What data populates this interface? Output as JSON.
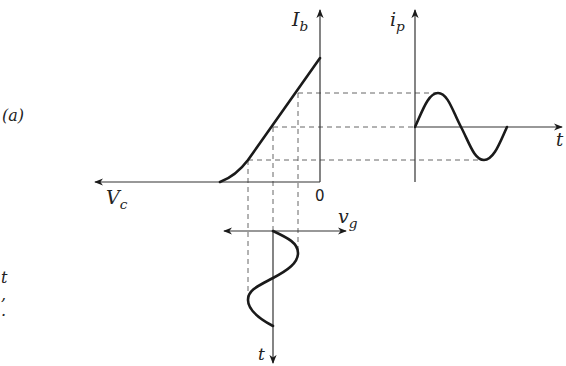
{
  "figure": {
    "panel_label": "(a)",
    "side_fragments": [
      "t",
      ",",
      "."
    ],
    "labels": {
      "ib_axis": {
        "main": "I",
        "sub": "b"
      },
      "ip_axis": {
        "main": "i",
        "sub": "p"
      },
      "vc_axis": {
        "main": "V",
        "sub": "c"
      },
      "vg_axis": {
        "main": "v",
        "sub": "g"
      },
      "t_right": "t",
      "t_bottom": "t",
      "origin": "0"
    },
    "colors": {
      "ink": "#1a1a1a",
      "axis": "#333333",
      "dash": "#555555",
      "background": "#ffffff"
    }
  },
  "geometry": {
    "transfer_axes": {
      "origin": [
        320,
        182
      ],
      "vertical_top": 10,
      "horizontal_left": 95
    },
    "transfer_curve": [
      [
        220,
        182
      ],
      [
        248,
        160
      ],
      [
        320,
        58
      ]
    ],
    "output_axes": {
      "origin": [
        415,
        127
      ],
      "vertical_top": 10,
      "vertical_bottom": 182,
      "horizontal_right": 560
    },
    "output_wave": {
      "start": [
        415,
        127
      ],
      "peak": [
        438,
        93
      ],
      "zero": [
        461,
        127
      ],
      "trough": [
        484,
        160
      ],
      "end": [
        507,
        127
      ]
    },
    "input_axes": {
      "origin": [
        273,
        231
      ],
      "left": 225,
      "right": 345,
      "bottom": 362
    },
    "input_wave": {
      "start": [
        273,
        231
      ],
      "peak": [
        298,
        253
      ],
      "zero": [
        273,
        278
      ],
      "trough": [
        248,
        300
      ],
      "end": [
        273,
        326
      ]
    },
    "dashed_horizontals_y": [
      93,
      127,
      160
    ],
    "dashed_verticals_x": [
      248,
      273,
      298
    ]
  }
}
